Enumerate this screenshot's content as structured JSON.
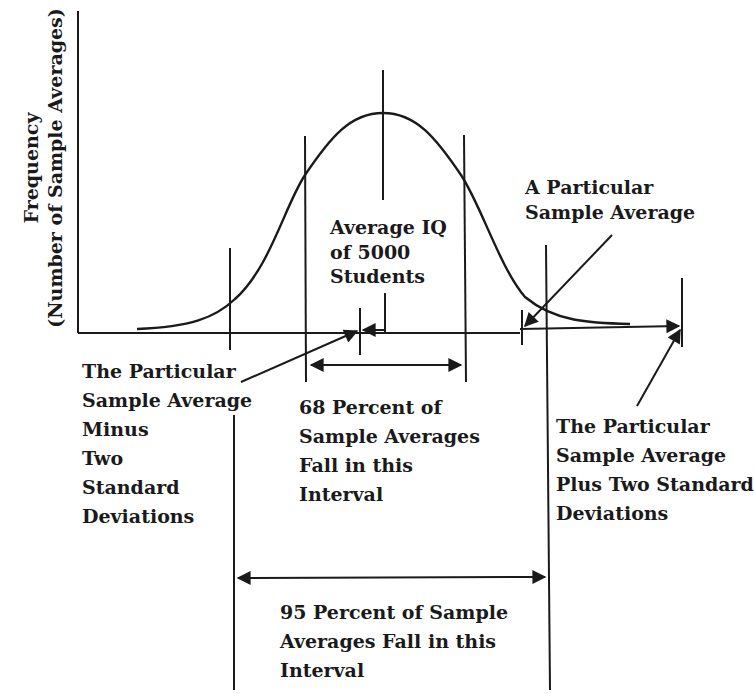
{
  "diagram": {
    "y_axis_label": {
      "line1": "Frequency",
      "line2": "(Number of Sample Averages)"
    },
    "labels": {
      "average_iq": [
        "Average IQ",
        "of 5000",
        "Students"
      ],
      "particular_sample": [
        "A Particular",
        "Sample Average"
      ],
      "minus_two_sd": [
        "The Particular",
        "Sample Average",
        "Minus",
        "Two",
        "Standard",
        "Deviations"
      ],
      "sixty_eight": [
        "68 Percent of",
        "Sample Averages",
        "Fall in this",
        "Interval"
      ],
      "plus_two_sd": [
        "The Particular",
        "Sample Average",
        "Plus Two Standard",
        "Deviations"
      ],
      "ninety_five": [
        "95 Percent of Sample",
        "Averages Fall in this",
        "Interval"
      ]
    },
    "colors": {
      "ink": "#1a1a1a",
      "background": "#ffffff"
    }
  }
}
